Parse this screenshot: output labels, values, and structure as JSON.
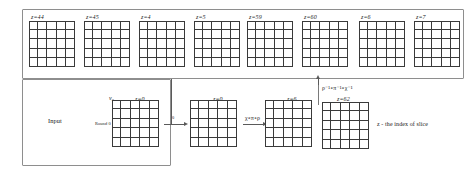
{
  "figure": {
    "caption_note": "z - the index of slice",
    "input_label": "Input",
    "round_label": "Round 0",
    "v0_label": "v₀",
    "bit_label": "0",
    "forward_transform": "χ∘π∘ρ",
    "inverse_transform": "ρ⁻¹∘π⁻¹∘χ⁻¹"
  },
  "top_row": {
    "slices": [
      {
        "label": "z=44",
        "rows": 5,
        "cols": 5,
        "cells": [
          [
            "white",
            "white",
            "white",
            "white",
            "mid"
          ],
          [
            "white",
            "white",
            "white",
            "white",
            "white"
          ],
          [
            "white",
            "white",
            "white",
            "white",
            "white"
          ],
          [
            "white",
            "white",
            "white",
            "white",
            "white"
          ],
          [
            "white",
            "white",
            "white",
            "white",
            "white"
          ]
        ]
      },
      {
        "label": "z=45",
        "rows": 5,
        "cols": 5,
        "cells": [
          [
            "white",
            "white",
            "mid",
            "white",
            "white"
          ],
          [
            "white",
            "white",
            "mid",
            "white",
            "white"
          ],
          [
            "white",
            "white",
            "white",
            "white",
            "white"
          ],
          [
            "white",
            "white",
            "white",
            "white",
            "white"
          ],
          [
            "white",
            "white",
            "white",
            "white",
            "white"
          ]
        ]
      },
      {
        "label": "z=4",
        "rows": 5,
        "cols": 5,
        "cells": [
          [
            "white",
            "white",
            "dark",
            "white",
            "white"
          ],
          [
            "white",
            "white",
            "dark",
            "white",
            "white"
          ],
          [
            "white",
            "white",
            "white",
            "white",
            "white"
          ],
          [
            "white",
            "white",
            "white",
            "white",
            "white"
          ],
          [
            "white",
            "white",
            "white",
            "white",
            "white"
          ]
        ]
      },
      {
        "label": "z=5",
        "rows": 5,
        "cols": 5,
        "cells": [
          [
            "dark",
            "dark",
            "white",
            "white",
            "white"
          ],
          [
            "dark",
            "white",
            "white",
            "white",
            "white"
          ],
          [
            "white",
            "white",
            "white",
            "white",
            "white"
          ],
          [
            "white",
            "white",
            "white",
            "white",
            "white"
          ],
          [
            "white",
            "white",
            "white",
            "white",
            "white"
          ]
        ]
      },
      {
        "label": "z=59",
        "rows": 5,
        "cols": 5,
        "cells": [
          [
            "white",
            "white",
            "dark",
            "white",
            "white"
          ],
          [
            "white",
            "white",
            "dark",
            "white",
            "white"
          ],
          [
            "white",
            "white",
            "white",
            "white",
            "white"
          ],
          [
            "white",
            "white",
            "white",
            "white",
            "white"
          ],
          [
            "white",
            "white",
            "white",
            "white",
            "white"
          ]
        ]
      },
      {
        "label": "z=60",
        "rows": 5,
        "cols": 5,
        "cells": [
          [
            "dark",
            "white",
            "white",
            "white",
            "white"
          ],
          [
            "dark",
            "white",
            "white",
            "white",
            "white"
          ],
          [
            "white",
            "white",
            "white",
            "white",
            "white"
          ],
          [
            "white",
            "white",
            "white",
            "white",
            "white"
          ],
          [
            "white",
            "white",
            "white",
            "white",
            "white"
          ]
        ]
      },
      {
        "label": "z=6",
        "rows": 5,
        "cols": 5,
        "cells": [
          [
            "white",
            "white",
            "white",
            "white",
            "light"
          ],
          [
            "white",
            "white",
            "white",
            "white",
            "light"
          ],
          [
            "white",
            "white",
            "white",
            "white",
            "white"
          ],
          [
            "white",
            "white",
            "white",
            "white",
            "white"
          ],
          [
            "white",
            "white",
            "white",
            "white",
            "white"
          ]
        ]
      },
      {
        "label": "z=7",
        "rows": 5,
        "cols": 5,
        "cells": [
          [
            "white",
            "white",
            "light",
            "white",
            "white"
          ],
          [
            "white",
            "white",
            "light",
            "white",
            "white"
          ],
          [
            "white",
            "white",
            "white",
            "white",
            "white"
          ],
          [
            "white",
            "white",
            "white",
            "white",
            "white"
          ],
          [
            "white",
            "white",
            "white",
            "white",
            "white"
          ]
        ]
      }
    ]
  },
  "bottom_row": {
    "slices": [
      {
        "label": "z=0",
        "rows": 5,
        "cols": 5,
        "cells": [
          [
            "white",
            "white",
            "black",
            "white",
            "white"
          ],
          [
            "white",
            "white",
            "black",
            "white",
            "white"
          ],
          [
            "white",
            "white",
            "white",
            "white",
            "white"
          ],
          [
            "white",
            "white",
            "white",
            "white",
            "white"
          ],
          [
            "white",
            "white",
            "white",
            "white",
            "white"
          ]
        ]
      },
      {
        "label": "z=0",
        "rows": 5,
        "cols": 5,
        "cells": [
          [
            "white",
            "white",
            "black",
            "white",
            "white"
          ],
          [
            "white",
            "white",
            "black",
            "white",
            "white"
          ],
          [
            "white",
            "white",
            "white",
            "white",
            "white"
          ],
          [
            "white",
            "white",
            "white",
            "white",
            "white"
          ],
          [
            "white",
            "white",
            "white",
            "white",
            "white"
          ]
        ]
      },
      {
        "label": "z=6",
        "rows": 5,
        "cols": 5,
        "cells": [
          [
            "white",
            "white",
            "white",
            "white",
            "white"
          ],
          [
            "white",
            "white",
            "white",
            "white",
            "white"
          ],
          [
            "mid",
            "black",
            "white",
            "white",
            "mid"
          ],
          [
            "white",
            "white",
            "white",
            "white",
            "white"
          ],
          [
            "white",
            "white",
            "white",
            "white",
            "white"
          ]
        ]
      },
      {
        "label": "z=62",
        "rows": 5,
        "cols": 5,
        "cells": [
          [
            "white",
            "white",
            "white",
            "white",
            "white"
          ],
          [
            "white",
            "white",
            "white",
            "white",
            "white"
          ],
          [
            "white",
            "white",
            "white",
            "white",
            "white"
          ],
          [
            "white",
            "white",
            "white",
            "white",
            "white"
          ],
          [
            "black",
            "white",
            "white",
            "dark",
            "light"
          ]
        ]
      }
    ]
  }
}
